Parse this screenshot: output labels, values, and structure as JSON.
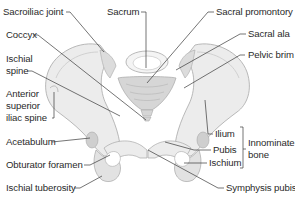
{
  "figure": {
    "colors": {
      "bone_fill": "#ececec",
      "bone_shade": "#d6d6d6",
      "bone_outline": "#a8a8a8",
      "leader_line": "#3a3a3a",
      "label_text": "#2a2a2a"
    },
    "labels": {
      "sacroiliac_joint": "Sacroiliac joint",
      "sacrum": "Sacrum",
      "sacral_promontory": "Sacral promontory",
      "coccyx": "Coccyx",
      "sacral_ala": "Sacral ala",
      "pelvic_brim": "Pelvic brim",
      "ischial_spine_1": "Ischial",
      "ischial_spine_2": "spine",
      "asis_1": "Anterior",
      "asis_2": "superior",
      "asis_3": "iliac spine",
      "acetabulum": "Acetabulum",
      "obturator_foramen": "Obturator foramen",
      "ischial_tuberosity": "Ischial tuberosity",
      "ilium": "Ilium",
      "pubis": "Pubis",
      "ischium": "Ischium",
      "innominate_1": "Innominate",
      "innominate_2": "bone",
      "symphysis_pubis": "Symphysis pubis"
    }
  }
}
